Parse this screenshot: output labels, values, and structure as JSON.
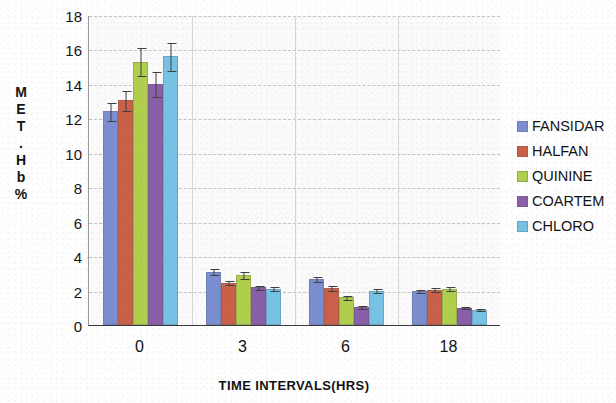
{
  "chart_data": {
    "type": "bar",
    "title": "",
    "xlabel": "TIME INTERVALS(HRS)",
    "ylabel": "MET.Hb%",
    "ylabel_stacked": [
      "M",
      "E",
      "T",
      ".",
      "H",
      "b",
      "%"
    ],
    "categories": [
      "0",
      "3",
      "6",
      "18"
    ],
    "ylim": [
      0,
      18
    ],
    "yticks": [
      0,
      2,
      4,
      6,
      8,
      10,
      12,
      14,
      16,
      18
    ],
    "grid": true,
    "legend_position": "right",
    "error_bars": "standard deviation",
    "series": [
      {
        "name": "FANSIDAR",
        "legend_lines": [
          "FANSIDA",
          "R"
        ],
        "color": "#7b8ed2",
        "values": [
          12.4,
          3.1,
          2.65,
          1.95
        ],
        "errors": [
          0.55,
          0.2,
          0.18,
          0.12
        ]
      },
      {
        "name": "HALFAN",
        "legend_lines": [
          "HALFAN"
        ],
        "color": "#cb6048",
        "values": [
          13.05,
          2.45,
          2.15,
          2.05
        ],
        "errors": [
          0.6,
          0.15,
          0.15,
          0.15
        ]
      },
      {
        "name": "QUININE",
        "legend_lines": [
          "QUININE"
        ],
        "color": "#b0cf4d",
        "values": [
          15.3,
          2.9,
          1.6,
          2.1
        ],
        "errors": [
          0.85,
          0.22,
          0.15,
          0.15
        ]
      },
      {
        "name": "COARTEM",
        "legend_lines": [
          "COARTE",
          "M"
        ],
        "color": "#8a5fa9",
        "values": [
          14.0,
          2.2,
          1.05,
          1.0
        ],
        "errors": [
          0.75,
          0.15,
          0.12,
          0.1
        ]
      },
      {
        "name": "CHLORO",
        "legend_lines": [
          "CHLORO"
        ],
        "color": "#76c3e6",
        "values": [
          15.6,
          2.1,
          2.0,
          0.9
        ],
        "errors": [
          0.85,
          0.15,
          0.15,
          0.1
        ]
      }
    ]
  }
}
